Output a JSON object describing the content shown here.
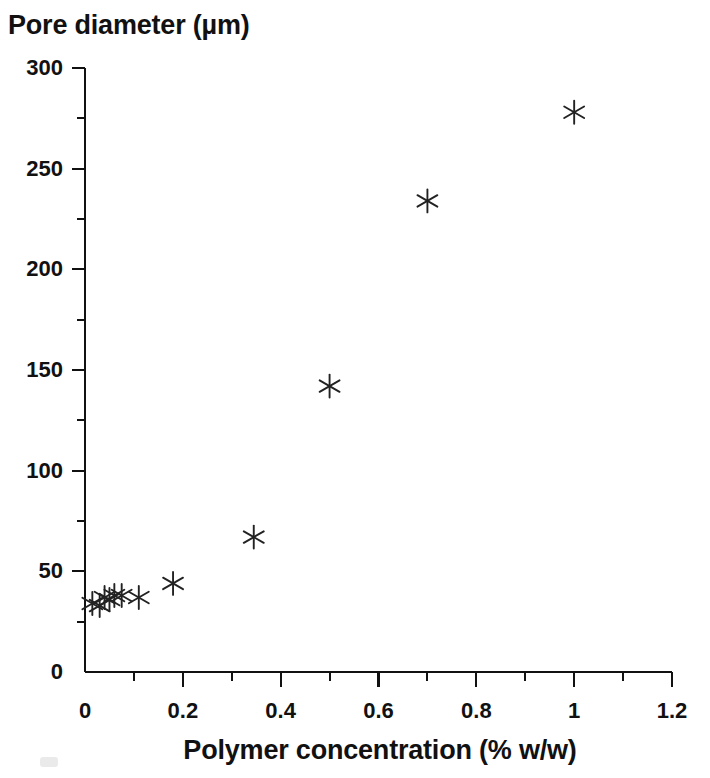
{
  "figure": {
    "background_color": "#ffffff",
    "ink_color": "#111111"
  },
  "chart_data": {
    "type": "scatter",
    "title": "",
    "ylabel": "Pore diameter (µm)",
    "xlabel": "Polymer concentration (% w/w)",
    "xlim": [
      0,
      1.2
    ],
    "ylim": [
      0,
      300
    ],
    "grid": false,
    "legend": null,
    "marker": "asterisk",
    "marker_color": "#222222",
    "x_major_ticks": [
      0,
      0.2,
      0.4,
      0.6,
      0.8,
      1,
      1.2
    ],
    "x_major_tick_labels": [
      "0",
      "0.2",
      "0.4",
      "0.6",
      "0.8",
      "1",
      "1.2"
    ],
    "x_minor_ticks": [
      0.1,
      0.3,
      0.5,
      0.7,
      0.9,
      1.1
    ],
    "y_major_ticks": [
      0,
      50,
      100,
      150,
      200,
      250,
      300
    ],
    "y_major_tick_labels": [
      "0",
      "50",
      "100",
      "150",
      "200",
      "250",
      "300"
    ],
    "y_minor_ticks": [
      25,
      75,
      125,
      175,
      225,
      275
    ],
    "points": [
      {
        "x": 0.015,
        "y": 34
      },
      {
        "x": 0.03,
        "y": 33
      },
      {
        "x": 0.04,
        "y": 37
      },
      {
        "x": 0.05,
        "y": 36
      },
      {
        "x": 0.06,
        "y": 38
      },
      {
        "x": 0.075,
        "y": 38
      },
      {
        "x": 0.11,
        "y": 37
      },
      {
        "x": 0.18,
        "y": 44
      },
      {
        "x": 0.345,
        "y": 67
      },
      {
        "x": 0.5,
        "y": 142
      },
      {
        "x": 0.7,
        "y": 234
      },
      {
        "x": 1.0,
        "y": 278
      }
    ]
  }
}
